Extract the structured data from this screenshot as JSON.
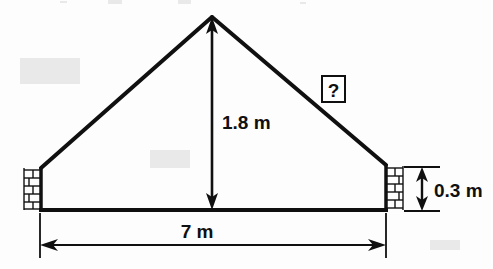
{
  "figure": {
    "type": "geometry-diagram",
    "background_color": "#fdfdfd",
    "ink_color": "#101010"
  },
  "labels": {
    "height": "1.8 m",
    "base": "7 m",
    "wall_height": "0.3 m",
    "unknown": "?"
  },
  "geometry": {
    "apex": {
      "x": 212,
      "y": 17
    },
    "left_eave": {
      "x": 41,
      "y": 168
    },
    "right_eave": {
      "x": 386,
      "y": 165
    },
    "base_left": {
      "x": 40,
      "y": 210
    },
    "base_right": {
      "x": 387,
      "y": 210
    },
    "base_line_y": 210,
    "height_arrow_x": 212,
    "base_dim_line_y": 245,
    "wall_dim_x": 422,
    "wall_dim_top_y": 167,
    "wall_dim_bottom_y": 211
  },
  "values": {
    "height_m": 1.8,
    "base_m": 7,
    "wall_height_m": 0.3,
    "slant_m": null
  },
  "annotations": {
    "question_box": {
      "x": 322,
      "y": 78,
      "width": 22,
      "height": 24
    }
  }
}
